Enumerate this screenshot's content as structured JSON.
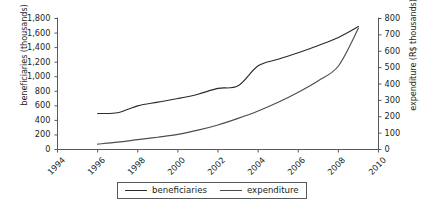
{
  "chart_data": {
    "type": "line",
    "title": "",
    "xlabel": "",
    "grid": false,
    "legend_position": "bottom-center",
    "x_axis": {
      "ticks": [
        "1994",
        "1996",
        "1998",
        "2000",
        "2002",
        "2004",
        "2006",
        "2008",
        "2010"
      ],
      "min": 1994,
      "max": 2010,
      "tick_step": 2
    },
    "y_axis_left": {
      "label": "beneficiaries (thousands)",
      "ticks": [
        "0",
        "200",
        "400",
        "600",
        "800",
        "1,000",
        "1,200",
        "1,400",
        "1,600",
        "1,800"
      ],
      "min": 0,
      "max": 1800,
      "tick_step": 200
    },
    "y_axis_right": {
      "label": "expenditure (R$ thousands)",
      "ticks": [
        "0",
        "100",
        "200",
        "300",
        "400",
        "500",
        "600",
        "700",
        "800"
      ],
      "min": 0,
      "max": 800,
      "tick_step": 100
    },
    "series": [
      {
        "name": "beneficiaries",
        "axis": "left",
        "color": "#2b2b2b",
        "x": [
          1996,
          1997,
          1998,
          1999,
          2000,
          2001,
          2002,
          2003,
          2004,
          2005,
          2006,
          2007,
          2008,
          2009
        ],
        "values": [
          495,
          505,
          600,
          650,
          700,
          760,
          840,
          875,
          1150,
          1240,
          1330,
          1430,
          1540,
          1690
        ]
      },
      {
        "name": "expenditure",
        "axis": "right",
        "color": "#4d4d4d",
        "x": [
          1996,
          1997,
          1998,
          1999,
          2000,
          2001,
          2002,
          2003,
          2004,
          2005,
          2006,
          2007,
          2008,
          2009
        ],
        "values": [
          33,
          45,
          60,
          75,
          92,
          118,
          150,
          190,
          235,
          288,
          350,
          420,
          510,
          740
        ]
      }
    ]
  },
  "legend": {
    "entries": [
      {
        "label": "beneficiaries",
        "color": "#2b2b2b"
      },
      {
        "label": "expenditure",
        "color": "#4d4d4d"
      }
    ]
  }
}
